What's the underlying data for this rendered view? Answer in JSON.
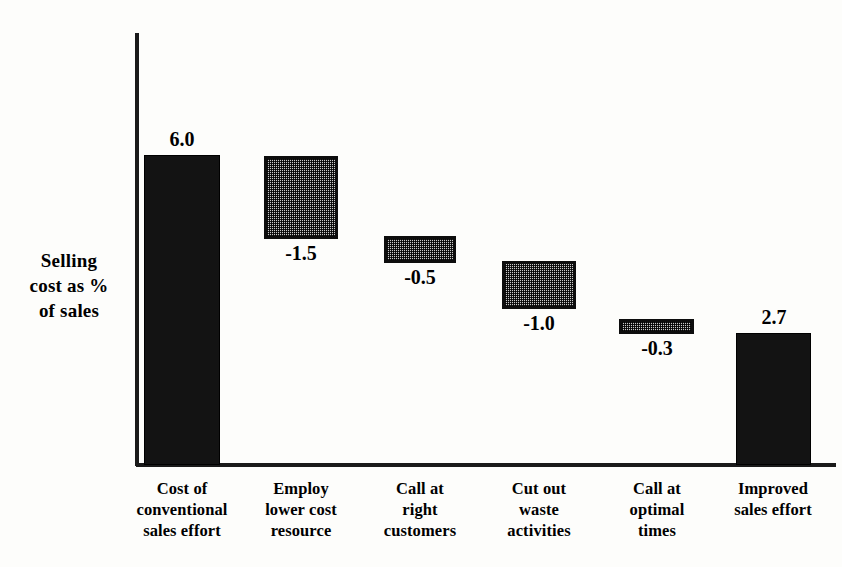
{
  "chart_data": {
    "type": "bar",
    "subtype": "waterfall",
    "title": "",
    "xlabel": "",
    "ylabel": "Selling cost as % of sales",
    "ylabel_lines": [
      "Selling",
      "cost as %",
      "of sales"
    ],
    "categories": [
      "Cost of conventional sales effort",
      "Employ lower cost resource",
      "Call at right customers",
      "Cut out waste activities",
      "Call at optimal times",
      "Improved sales effort"
    ],
    "category_lines": [
      [
        "Cost of",
        "conventional",
        "sales effort"
      ],
      [
        "Employ",
        "lower cost",
        "resource"
      ],
      [
        "Call at",
        "right",
        "customers"
      ],
      [
        "Cut out",
        "waste",
        "activities"
      ],
      [
        "Call at",
        "optimal",
        "times"
      ],
      [
        "Improved",
        "sales effort"
      ]
    ],
    "values": [
      6.0,
      -1.5,
      -0.5,
      -1.0,
      -0.3,
      2.7
    ],
    "value_labels": [
      "6.0",
      "-1.5",
      "-0.5",
      "-1.0",
      "-0.3",
      "2.7"
    ],
    "bar_kinds": [
      "total",
      "delta",
      "delta",
      "delta",
      "delta",
      "total"
    ],
    "cumulative_top": [
      6.0,
      6.0,
      4.5,
      4.0,
      3.0,
      2.7
    ],
    "cumulative_bottom": [
      0.0,
      4.5,
      4.0,
      3.0,
      2.7,
      0.0
    ],
    "ylim": [
      0,
      8.4
    ],
    "grid": false,
    "legend": null,
    "axis_color": "#1a1a1a",
    "total_bar_color": "#131313",
    "delta_bar_fill": "#8a8a8a",
    "delta_bar_border": "#0d0d0d",
    "background": "#fdfdfb"
  },
  "bars": [
    {
      "id": "bar-cost-of-conventional-sales-effort",
      "label": "6.0",
      "left": 144,
      "top": 155,
      "width": 76,
      "height": 310,
      "style": "solid",
      "label_left": 140,
      "label_top": 129,
      "label_width": 84
    },
    {
      "id": "bar-employ-lower-cost-resource",
      "label": "-1.5",
      "left": 264,
      "top": 156,
      "width": 74,
      "height": 83,
      "style": "hatched",
      "label_left": 259,
      "label_top": 243,
      "label_width": 84
    },
    {
      "id": "bar-call-at-right-customers",
      "label": "-0.5",
      "left": 384,
      "top": 236,
      "width": 72,
      "height": 27,
      "style": "hatched",
      "label_left": 378,
      "label_top": 267,
      "label_width": 84
    },
    {
      "id": "bar-cut-out-waste-activities",
      "label": "-1.0",
      "left": 502,
      "top": 261,
      "width": 74,
      "height": 48,
      "style": "hatched",
      "label_left": 497,
      "label_top": 313,
      "label_width": 84
    },
    {
      "id": "bar-call-at-optimal-times",
      "label": "-0.3",
      "left": 619,
      "top": 319,
      "width": 75,
      "height": 15,
      "style": "hatched",
      "label_left": 615,
      "label_top": 338,
      "label_width": 84
    },
    {
      "id": "bar-improved-sales-effort",
      "label": "2.7",
      "left": 736,
      "top": 333,
      "width": 75,
      "height": 132,
      "style": "solid",
      "label_left": 732,
      "label_top": 307,
      "label_width": 84
    }
  ],
  "category_positions": [
    {
      "left": 112,
      "width": 140
    },
    {
      "left": 231,
      "width": 140
    },
    {
      "left": 350,
      "width": 140
    },
    {
      "left": 469,
      "width": 140
    },
    {
      "left": 587,
      "width": 140
    },
    {
      "left": 703,
      "width": 140
    }
  ]
}
